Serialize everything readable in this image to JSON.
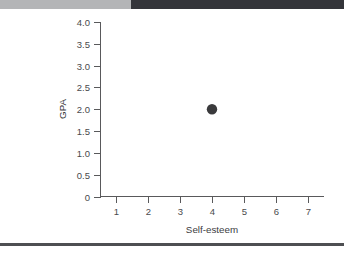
{
  "banner": {
    "text": "",
    "bg_color": "#34353a",
    "left_block_color": "#b4b5b7"
  },
  "bottom_rule": {
    "color": "#4e4f52"
  },
  "chart_data": {
    "type": "scatter",
    "title": "",
    "xlabel": "Self-esteem",
    "ylabel": "GPA",
    "x": [
      4
    ],
    "y": [
      2.0
    ],
    "points": [
      {
        "x": 4,
        "y": 2.0
      }
    ],
    "xlim": [
      0.5,
      7.5
    ],
    "ylim": [
      0,
      4.0
    ],
    "xticks": [
      1,
      2,
      3,
      4,
      5,
      6,
      7
    ],
    "xtick_labels": [
      "1",
      "2",
      "3",
      "4",
      "5",
      "6",
      "7"
    ],
    "yticks": [
      0,
      0.5,
      1.0,
      1.5,
      2.0,
      2.5,
      3.0,
      3.5,
      4.0
    ],
    "ytick_labels": [
      "0",
      "0.5",
      "1.0",
      "1.5",
      "2.0",
      "2.5",
      "3.0",
      "3.5",
      "4.0"
    ],
    "grid": false,
    "legend": null,
    "marker_color": "#3a3a3c",
    "axis_color": "#59595b"
  }
}
